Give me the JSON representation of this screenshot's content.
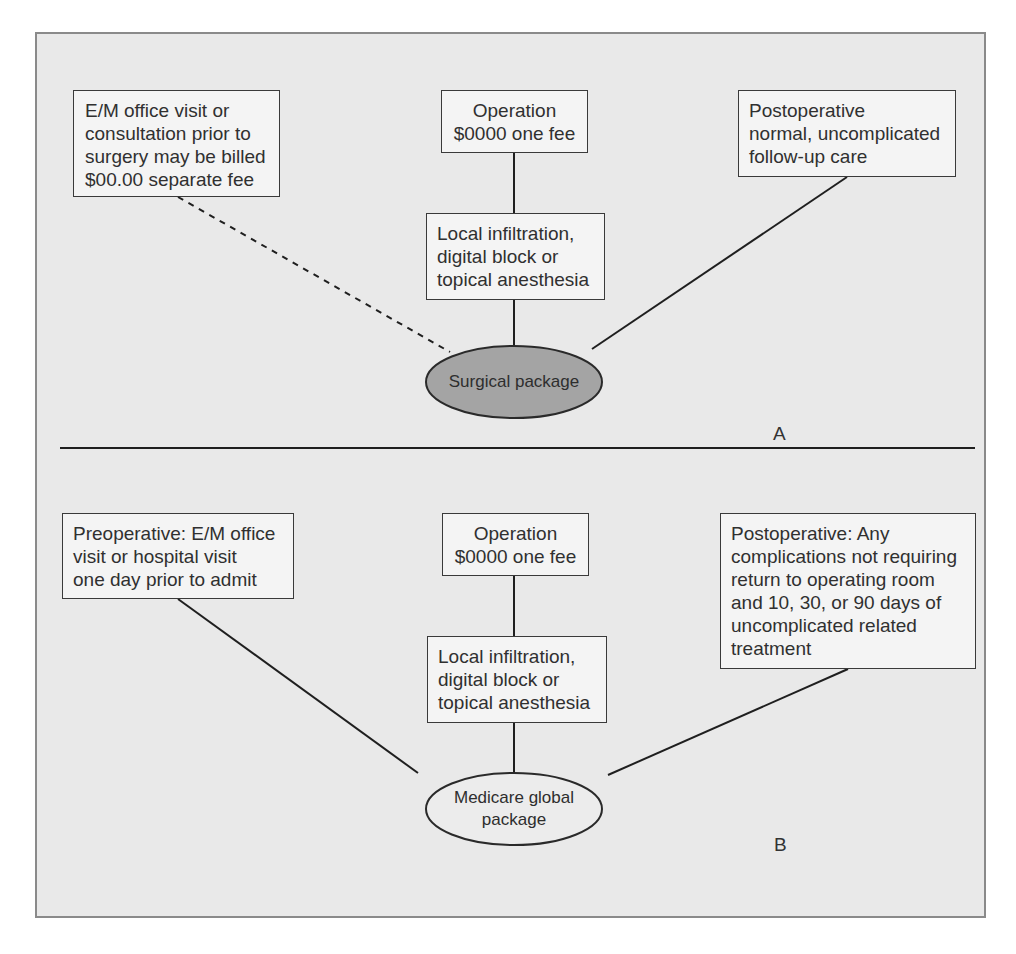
{
  "colors": {
    "frame_bg": "#e9e9e9",
    "frame_border": "#8a8a8a",
    "box_bg": "#f4f4f4",
    "box_border": "#3a3a3a",
    "surgical_package_fill": "#a4a4a4",
    "medicare_package_fill": "#ececec",
    "line": "#1f1f1f"
  },
  "panel_a": {
    "label": "A",
    "preop_box": {
      "lines": [
        "E/M office visit or",
        "consultation prior to",
        "surgery may be billed",
        "$00.00 separate fee"
      ],
      "connector": "dashed"
    },
    "operation_box": {
      "lines": [
        "Operation",
        "$0000 one fee"
      ]
    },
    "anesthesia_box": {
      "lines": [
        "Local infiltration,",
        "digital block or",
        "topical anesthesia"
      ]
    },
    "postop_box": {
      "lines": [
        "Postoperative",
        "normal, uncomplicated",
        "follow-up care"
      ]
    },
    "package": {
      "lines": [
        "Surgical package"
      ],
      "shape": "ellipse",
      "fill": "dark-gray"
    }
  },
  "panel_b": {
    "label": "B",
    "preop_box": {
      "lines": [
        "Preoperative: E/M office",
        "visit or hospital visit",
        "one day prior to admit"
      ],
      "connector": "solid"
    },
    "operation_box": {
      "lines": [
        "Operation",
        "$0000 one fee"
      ]
    },
    "anesthesia_box": {
      "lines": [
        "Local infiltration,",
        "digital block or",
        "topical anesthesia"
      ]
    },
    "postop_box": {
      "lines": [
        "Postoperative: Any",
        "complications not requiring",
        "return to operating room",
        "and 10, 30, or 90 days of",
        "uncomplicated related",
        "treatment"
      ]
    },
    "package": {
      "lines": [
        "Medicare global",
        "package"
      ],
      "shape": "ellipse",
      "fill": "light-gray"
    }
  }
}
